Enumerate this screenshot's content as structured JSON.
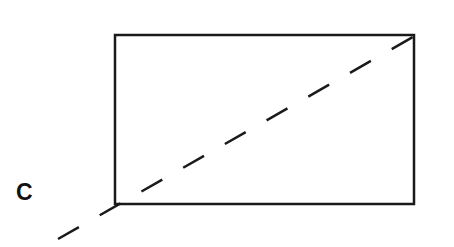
{
  "diagram": {
    "label": "C",
    "colors": {
      "stroke": "#1a1a1a",
      "background": "#ffffff"
    },
    "rectangle": {
      "x": 115,
      "y": 35,
      "width": 299,
      "height": 169
    },
    "diagonal": {
      "x1": 58,
      "y1": 239,
      "x2": 427,
      "y2": 29,
      "dash": "24,24"
    }
  }
}
